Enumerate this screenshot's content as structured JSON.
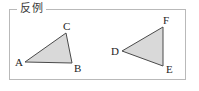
{
  "figure": {
    "frame": {
      "legend_label": "反例",
      "border_color": "#b9b9b9",
      "background_color": "#ffffff"
    },
    "style": {
      "fill_color": "#d9d9d9",
      "stroke_color": "#4a4a4a",
      "label_color": "#1e1e1e"
    },
    "shapes": [
      {
        "name": "triangle-abc",
        "type": "triangle",
        "points": "25,62 72,63 66,33",
        "vertices": [
          {
            "label": "A",
            "x": 25,
            "y": 62,
            "label_x": 15,
            "label_y": 57
          },
          {
            "label": "B",
            "x": 72,
            "y": 63,
            "label_x": 74,
            "label_y": 63
          },
          {
            "label": "C",
            "x": 66,
            "y": 33,
            "label_x": 63,
            "label_y": 21
          }
        ]
      },
      {
        "name": "triangle-def",
        "type": "triangle",
        "points": "122,51 163,27 163,66",
        "vertices": [
          {
            "label": "D",
            "x": 122,
            "y": 51,
            "label_x": 111,
            "label_y": 46
          },
          {
            "label": "E",
            "x": 163,
            "y": 66,
            "label_x": 166,
            "label_y": 64
          },
          {
            "label": "F",
            "x": 163,
            "y": 27,
            "label_x": 163,
            "label_y": 15
          }
        ]
      }
    ]
  }
}
